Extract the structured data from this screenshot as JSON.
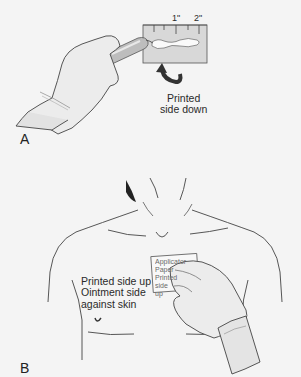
{
  "figure": {
    "panels": [
      {
        "id": "A",
        "label": "A",
        "ruler_ticks": [
          "1\"",
          "2\""
        ],
        "caption": "Printed\nside down"
      },
      {
        "id": "B",
        "label": "B",
        "caption": "Printed side up\nOintment side\nagainst skin",
        "paper_text": "Applicator\nPaper\nPrinted side\nup"
      }
    ],
    "colors": {
      "background": "#f4f4f4",
      "line": "#3a3a3a",
      "glove": "#ececec",
      "paper": "#dcdcdc",
      "arrow": "#333333",
      "shadow": "#222222"
    }
  }
}
